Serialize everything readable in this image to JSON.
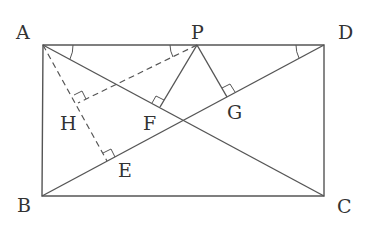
{
  "diagram": {
    "type": "geometry",
    "points": {
      "A": {
        "label": "A",
        "x": 43,
        "y": 45
      },
      "B": {
        "label": "B",
        "x": 42,
        "y": 196
      },
      "C": {
        "label": "C",
        "x": 324,
        "y": 196
      },
      "D": {
        "label": "D",
        "x": 324,
        "y": 45
      },
      "P": {
        "label": "P",
        "x": 197,
        "y": 45
      },
      "E": {
        "label": "E",
        "x": 107,
        "y": 161
      },
      "F": {
        "label": "F",
        "x": 160,
        "y": 107
      },
      "G": {
        "label": "G",
        "x": 227,
        "y": 97
      },
      "H": {
        "label": "H",
        "x": 78,
        "y": 103
      }
    },
    "solid_segments": [
      "AB",
      "BC",
      "CD",
      "DA",
      "AC",
      "BD",
      "PF",
      "PG"
    ],
    "dashed_segments": [
      "AE",
      "PH"
    ],
    "right_angles": [
      "E",
      "F",
      "G",
      "H"
    ],
    "angle_marks": [
      "angle DAC at A",
      "angle APH at P",
      "angle ADB at D"
    ]
  }
}
